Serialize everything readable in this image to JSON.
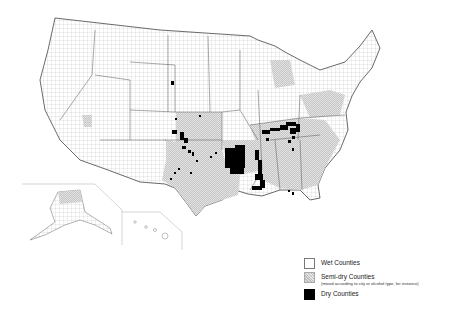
{
  "map": {
    "title": "Dry, semi-dry and wet counties of the United States",
    "regions": [
      "Contiguous United States",
      "Alaska inset",
      "Hawaii inset"
    ],
    "colors": {
      "wet": "#ffffff",
      "semi_dry": "#cfcfcf",
      "dry": "#000000",
      "border": "#555555"
    }
  },
  "legend": {
    "items": [
      {
        "key": "wet",
        "label": "Wet Counties",
        "sublabel": ""
      },
      {
        "key": "semi",
        "label": "Semi-dry Counties",
        "sublabel": "(mixed according to city or alcohol type, for instance)"
      },
      {
        "key": "dry",
        "label": "Dry Counties",
        "sublabel": ""
      }
    ]
  }
}
